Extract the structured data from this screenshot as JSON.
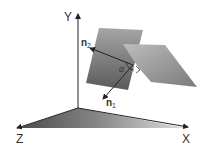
{
  "diagram": {
    "axes": {
      "x_label": "X",
      "y_label": "Y",
      "z_label": "Z"
    },
    "normals": {
      "n1_base": "n",
      "n1_sub": "1",
      "n2_base": "n",
      "n2_sub": "2"
    },
    "angle_label": "α",
    "colors": {
      "axis": "#222222",
      "plane_dark": "#555555",
      "plane_light": "#9a9a9a",
      "floor_dark": "#555555"
    }
  }
}
